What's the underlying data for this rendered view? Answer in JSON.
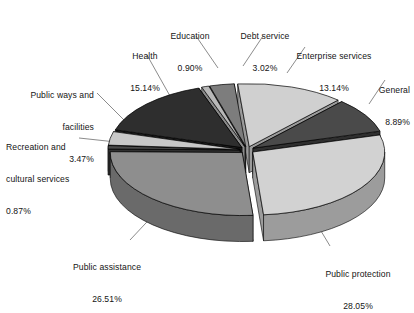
{
  "chart_data": {
    "type": "pie",
    "title": "",
    "subtitle": "",
    "xlabel": "",
    "ylabel": "",
    "legend_position": "labels-with-leader-lines",
    "grid": false,
    "value_unit": "percent",
    "style": {
      "three_d": true,
      "exploded": true,
      "background": "#ffffff",
      "text_color": "#141414",
      "edge_color": "#000000"
    },
    "categories": [
      "Enterprise services",
      "General",
      "Public protection",
      "Public assistance",
      "Recreation and cultural services",
      "Public ways and facilities",
      "Health",
      "Education",
      "Debt service"
    ],
    "values": [
      13.14,
      8.89,
      28.05,
      26.51,
      0.87,
      3.47,
      15.14,
      0.9,
      3.02
    ],
    "slices": [
      {
        "label": "Enterprise services",
        "value": 13.14,
        "value_label": "13.14%",
        "color": "#d0d0d0",
        "side_color": "#9a9a9a",
        "label_pos": {
          "x": 282,
          "y": 30
        },
        "align": "left"
      },
      {
        "label": "General",
        "value": 8.89,
        "value_label": "8.89%",
        "color": "#4a4a4a",
        "side_color": "#2f2f2f",
        "label_pos": {
          "x": 352,
          "y": 66
        },
        "align": "left"
      },
      {
        "label": "Public protection",
        "value": 28.05,
        "value_label": "28.05%",
        "color": "#d2d2d2",
        "side_color": "#9c9c9c",
        "label_pos": {
          "x": 310,
          "y": 252
        },
        "align": "left"
      },
      {
        "label": "Public assistance",
        "value": 26.51,
        "value_label": "26.51%",
        "color": "#8e8e8e",
        "side_color": "#6a6a6a",
        "label_pos": {
          "x": 68,
          "y": 245
        },
        "align": "left"
      },
      {
        "label": "Recreation and cultural services",
        "value": 0.87,
        "value_label": "0.87%",
        "color": "#4a4a4a",
        "side_color": "#303030",
        "label_pos": {
          "x": 8,
          "y": 122
        },
        "align": "left"
      },
      {
        "label": "Public ways and facilities",
        "value": 3.47,
        "value_label": "3.47%",
        "color": "#c8c8c8",
        "side_color": "#969696",
        "label_pos": {
          "x": 22,
          "y": 70
        },
        "align": "left"
      },
      {
        "label": "Health",
        "value": 15.14,
        "value_label": "15.14%",
        "color": "#2e2e2e",
        "side_color": "#1d1d1d",
        "label_pos": {
          "x": 120,
          "y": 44
        },
        "align": "left"
      },
      {
        "label": "Education",
        "value": 0.9,
        "value_label": "0.90%",
        "color": "#b8b8b8",
        "side_color": "#8a8a8a",
        "label_pos": {
          "x": 156,
          "y": 12
        },
        "align": "left"
      },
      {
        "label": "Debt service",
        "value": 3.02,
        "value_label": "3.02%",
        "color": "#7d7d7d",
        "side_color": "#5a5a5a",
        "label_pos": {
          "x": 228,
          "y": 12
        },
        "align": "left"
      }
    ]
  },
  "labels": {
    "education": {
      "name": "Education",
      "pct": "0.90%"
    },
    "debt_service": {
      "name": "Debt service",
      "pct": "3.02%"
    },
    "enterprise_services": {
      "name": "Enterprise services",
      "pct": "13.14%"
    },
    "general": {
      "name": "General",
      "pct": "8.89%"
    },
    "health": {
      "name": "Health",
      "pct": "15.14%"
    },
    "public_ways": {
      "name_line1": "Public ways and",
      "name_line2": "facilities",
      "pct": "3.47%"
    },
    "recreation": {
      "name_line1": "Recreation and",
      "name_line2": "cultural services",
      "pct": "0.87%"
    },
    "public_assistance": {
      "name": "Public assistance",
      "pct": "26.51%"
    },
    "public_protection": {
      "name": "Public protection",
      "pct": "28.05%"
    }
  }
}
